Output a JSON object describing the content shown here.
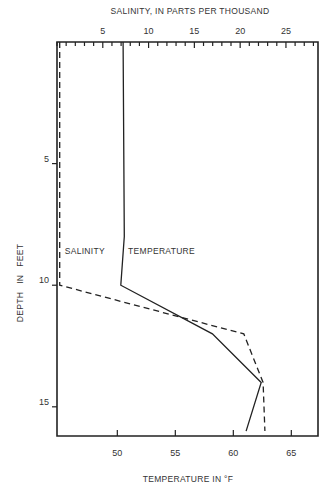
{
  "chart_data": {
    "type": "line",
    "title": "",
    "top_axis_label": "SALINITY, IN PARTS PER THOUSAND",
    "bottom_axis_label": "TEMPERATURE IN °F",
    "y_axis_label": "DEPTH   IN   FEET",
    "y_axis": {
      "range": [
        0,
        16.2
      ],
      "inverted": true,
      "ticks": [
        5,
        10,
        15
      ],
      "tick_labels": [
        "5",
        "10",
        "15"
      ]
    },
    "bottom_x_axis": {
      "range": [
        44.8,
        67.3
      ],
      "ticks": [
        50,
        55,
        60,
        65
      ],
      "tick_labels": [
        "50",
        "55",
        "60",
        "65"
      ]
    },
    "top_x_axis": {
      "range": [
        0,
        28.5
      ],
      "major_ticks": [
        5,
        10,
        15,
        20,
        25
      ],
      "tick_labels": [
        "5",
        "10",
        "15",
        "20",
        "25"
      ],
      "minor_tick_step": 1
    },
    "grid": false,
    "series": [
      {
        "name": "TEMPERATURE",
        "axis": "bottom",
        "style": "solid",
        "points": [
          {
            "value": 50.5,
            "depth": 0
          },
          {
            "value": 50.6,
            "depth": 8
          },
          {
            "value": 50.3,
            "depth": 10
          },
          {
            "value": 58.2,
            "depth": 12
          },
          {
            "value": 62.4,
            "depth": 14
          },
          {
            "value": 61.1,
            "depth": 16
          }
        ]
      },
      {
        "name": "SALINITY",
        "axis": "top",
        "style": "dashed",
        "points": [
          {
            "value": 0.3,
            "depth": 0
          },
          {
            "value": 0.3,
            "depth": 10
          },
          {
            "value": 20.4,
            "depth": 12
          },
          {
            "value": 22.5,
            "depth": 14
          },
          {
            "value": 22.7,
            "depth": 16
          }
        ]
      }
    ],
    "annotations": [
      {
        "text": "SALINITY",
        "near_series": "SALINITY",
        "depth": 8.7
      },
      {
        "text": "TEMPERATURE",
        "near_series": "TEMPERATURE",
        "depth": 8.7
      }
    ]
  }
}
